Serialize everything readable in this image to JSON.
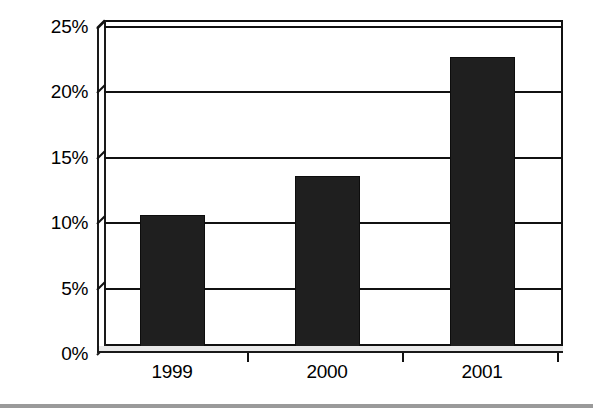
{
  "chart_data": {
    "type": "bar",
    "title": "",
    "subtitle": "",
    "xlabel": "",
    "ylabel": "",
    "categories": [
      "1999",
      "2000",
      "2001"
    ],
    "values": [
      10.5,
      13.5,
      22.6
    ],
    "value_format": "percent",
    "ylim": [
      0,
      25
    ],
    "y_ticks": [
      0,
      5,
      10,
      15,
      20,
      25
    ],
    "y_tick_labels": [
      "0%",
      "5%",
      "10%",
      "15%",
      "20%",
      "25%"
    ],
    "grid": true,
    "grid_axis": "y",
    "legend": false,
    "legend_position": "none",
    "series": [
      {
        "name": "",
        "values": [
          10.5,
          13.5,
          22.6
        ]
      }
    ],
    "style": {
      "bar_color": "#1f1f1f",
      "bar_edge_color": "#0d0d0d",
      "axis_color": "#111111",
      "grid_color": "#111111",
      "plot_background": "#ffffff",
      "footer_rule_color": "#9a9a9a",
      "three_d": true
    },
    "annotations": []
  },
  "axes": {
    "y_tick_labels": [
      "25%",
      "20%",
      "15%",
      "10%",
      "5%",
      "0%"
    ],
    "x_tick_labels": [
      "1999",
      "2000",
      "2001"
    ]
  }
}
